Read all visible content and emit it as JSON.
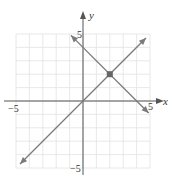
{
  "chart_data": {
    "type": "line",
    "title": "",
    "xlabel": "x",
    "ylabel": "y",
    "xlim": [
      -5,
      5
    ],
    "ylim": [
      -5,
      5
    ],
    "grid": true,
    "tick_labels": {
      "x_min": "−5",
      "x_max": "5",
      "y_max": "5",
      "y_min": "−5"
    },
    "series": [
      {
        "name": "y = x",
        "x": [
          -4.7,
          4.7
        ],
        "y": [
          -4.7,
          4.7
        ]
      },
      {
        "name": "y = -x + 4",
        "x": [
          -0.9,
          4.9
        ],
        "y": [
          4.9,
          -0.9
        ]
      }
    ],
    "annotations": [
      {
        "type": "point",
        "x": 2,
        "y": 2,
        "label": "intersection"
      }
    ]
  },
  "colors": {
    "grid": "#e2e2e2",
    "axis": "#555555",
    "line": "#7a7a7a",
    "point": "#666666"
  }
}
